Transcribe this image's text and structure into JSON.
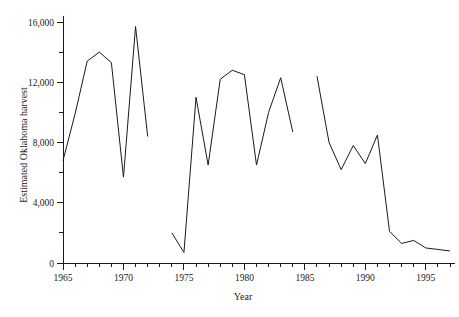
{
  "chart_data": {
    "type": "line",
    "title": "",
    "xlabel": "Year",
    "ylabel": "Estimated Oklahoma harvest",
    "xlim": [
      1965,
      1997
    ],
    "ylim": [
      0,
      16000
    ],
    "grid": false,
    "legend_position": "none",
    "x_major_ticks": [
      1965,
      1970,
      1975,
      1980,
      1985,
      1990,
      1995
    ],
    "x_major_tick_labels": [
      "1965",
      "1970",
      "1975",
      "1980",
      "1985",
      "1990",
      "1995"
    ],
    "x_minor_tick_interval": 1,
    "y_major_ticks": [
      0,
      4000,
      8000,
      12000,
      16000
    ],
    "y_major_tick_labels": [
      "0",
      "4,000",
      "8,000",
      "12,000",
      "16,000"
    ],
    "y_minor_ticks": [
      2000,
      6000,
      10000,
      14000
    ],
    "series": [
      {
        "name": "Estimated Oklahoma harvest",
        "color": "#1a1a1a",
        "segments": [
          {
            "x": [
              1965,
              1966,
              1967,
              1968,
              1969,
              1970,
              1971
            ],
            "values": [
              6800,
              9900,
              13400,
              14000,
              13300,
              5700,
              15700
            ]
          },
          {
            "x": [
              1971,
              1972
            ],
            "values": [
              15700,
              8400
            ]
          },
          {
            "x": [
              1974,
              1975,
              1976,
              1977,
              1978,
              1979,
              1980,
              1981,
              1982,
              1983,
              1984
            ],
            "values": [
              2000,
              700,
              11000,
              6500,
              12200,
              12800,
              12500,
              6500,
              10000,
              12300,
              8700
            ]
          },
          {
            "x": [
              1986,
              1987,
              1988,
              1989,
              1990,
              1991,
              1992,
              1993,
              1994,
              1995,
              1996,
              1997
            ],
            "values": [
              12400,
              8000,
              6200,
              7800,
              6600,
              8500,
              2100,
              1300,
              1500,
              1000,
              900,
              800
            ]
          }
        ]
      }
    ]
  },
  "axes": {
    "y_title": "Estimated Oklahoma harvest",
    "x_title": "Year"
  }
}
